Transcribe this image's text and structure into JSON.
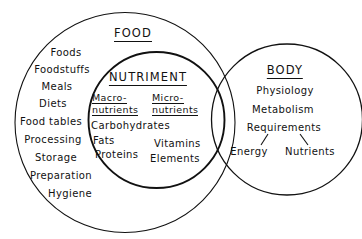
{
  "diagram": {
    "title_food": "FOOD",
    "title_nutriment": "NUTRIMENT",
    "title_body": "BODY",
    "food_items": [
      "Foods",
      "Foodstuffs",
      "Meals",
      "Diets",
      "Food tables",
      "Processing",
      "Storage",
      "Preparation",
      "Hygiene"
    ],
    "macro": {
      "label_line1": "Macro-",
      "label_line2": "nutrients",
      "items": [
        "Carbohydrates",
        "Fats",
        "Proteins"
      ]
    },
    "micro": {
      "label_line1": "Micro-",
      "label_line2": "nutrients",
      "items": [
        "Vitamins",
        "Elements"
      ]
    },
    "body_items": [
      "Physiology",
      "Metabolism",
      "Requirements"
    ],
    "body_branches": [
      "Energy",
      "Nutrients"
    ],
    "colors": {
      "stroke": "#111111",
      "text": "#111111",
      "background": "#ffffff"
    }
  }
}
